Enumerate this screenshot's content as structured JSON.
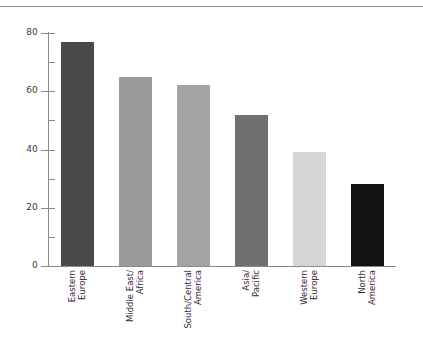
{
  "chart_data": {
    "type": "bar",
    "title": "",
    "subtitle": "",
    "xlabel": "",
    "ylabel": "",
    "categories": [
      "Eastern Europe",
      "Middle East/Africa",
      "South/Central America",
      "Asia/Pacific",
      "Western Europe",
      "North America"
    ],
    "category_lines": [
      [
        "Eastern",
        "Europe"
      ],
      [
        "Middle East/",
        "Africa"
      ],
      [
        "South/Central",
        "America"
      ],
      [
        "Asia/",
        "Pacific"
      ],
      [
        "Western",
        "Europe"
      ],
      [
        "North",
        "America"
      ]
    ],
    "values": [
      77,
      65,
      62,
      52,
      39,
      28
    ],
    "bar_colors": [
      "#4a4a4a",
      "#9b9b9b",
      "#a4a4a4",
      "#6f6f6f",
      "#d6d6d6",
      "#121212"
    ],
    "ylim": [
      0,
      80
    ],
    "ymajor_ticks": [
      0,
      20,
      40,
      60,
      80
    ],
    "ymajor_labels": [
      "0",
      "20",
      "40",
      "60",
      "80"
    ],
    "yminor_ticks": [
      10,
      30,
      50,
      70
    ],
    "grid": false,
    "legend": false,
    "legend_position": "none",
    "axis_color": "#8a8a8a",
    "label_color": "#2f2f2f"
  },
  "decor": {
    "top_rule_color": "#8d8d8d"
  }
}
